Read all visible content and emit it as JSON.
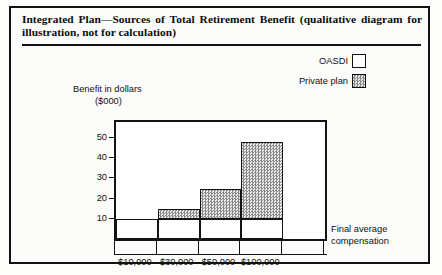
{
  "figure": {
    "title": "Integrated Plan—Sources of Total Retirement Benefit (qualitative diagram for illustration, not for calculation)"
  },
  "legend": {
    "items": [
      {
        "label": "OASDI",
        "swatch": "white-box",
        "color": "#ffffff"
      },
      {
        "label": "Private plan",
        "swatch": "stippled-box",
        "color": "#c6c6c6"
      }
    ]
  },
  "axes": {
    "y_title_line1": "Benefit in dollars",
    "y_title_line2": "($000)",
    "x_title_line1": "Final average",
    "x_title_line2": "compensation"
  },
  "chart_data": {
    "type": "bar",
    "title": "Integrated Plan—Sources of Total Retirement Benefit (qualitative diagram for illustration, not for calculation)",
    "stacked": true,
    "categories": [
      "$10,000",
      "$30,000",
      "$50,000",
      "$100,000"
    ],
    "series": [
      {
        "name": "OASDI",
        "values": [
          10,
          10,
          10,
          10
        ],
        "color": "#ffffff"
      },
      {
        "name": "Private plan",
        "values": [
          0,
          5,
          15,
          38
        ],
        "color": "#c6c6c6"
      }
    ],
    "totals": [
      10,
      15,
      25,
      48
    ],
    "xlabel": "Final average compensation",
    "ylabel": "Benefit in dollars ($000)",
    "ylim": [
      0,
      58
    ],
    "yticks": [
      10,
      20,
      30,
      40,
      50
    ],
    "ytick_labels": [
      "10",
      "20",
      "30",
      "40",
      "50"
    ],
    "grid": false,
    "legend_position": "top-right",
    "n_axis_slots": 5,
    "note": "Qualitative illustrative diagram; values estimated from axis scale."
  }
}
